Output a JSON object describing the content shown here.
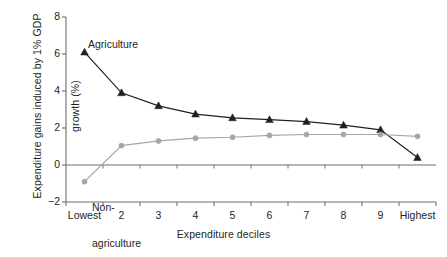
{
  "chart_data": {
    "type": "line",
    "title": "",
    "xlabel": "Expenditure deciles",
    "ylabel": "Expenditure gains induced by 1% GDP growth (%)",
    "ylabel_line1": "Expenditure gains induced by 1% GDP",
    "ylabel_line2": "growth (%)",
    "categories": [
      "Lowest",
      "2",
      "3",
      "4",
      "5",
      "6",
      "7",
      "8",
      "9",
      "Highest"
    ],
    "ylim": [
      -2,
      8
    ],
    "yticks": [
      -2,
      0,
      2,
      4,
      6,
      8
    ],
    "ytick_labels": [
      "−2",
      "0",
      "2",
      "4",
      "6",
      "8"
    ],
    "grid": false,
    "legend_position": "inline-annotations",
    "zero_line": true,
    "series": [
      {
        "name": "Agriculture",
        "color": "#231f20",
        "marker": "triangle",
        "values": [
          6.1,
          3.9,
          3.2,
          2.75,
          2.55,
          2.45,
          2.35,
          2.15,
          1.9,
          0.4
        ]
      },
      {
        "name": "Non-agriculture",
        "label_line1": "Non-",
        "label_line2": "agriculture",
        "color": "#a6a6a6",
        "marker": "circle",
        "values": [
          -0.9,
          1.05,
          1.3,
          1.45,
          1.5,
          1.6,
          1.65,
          1.65,
          1.65,
          1.55
        ]
      }
    ]
  }
}
